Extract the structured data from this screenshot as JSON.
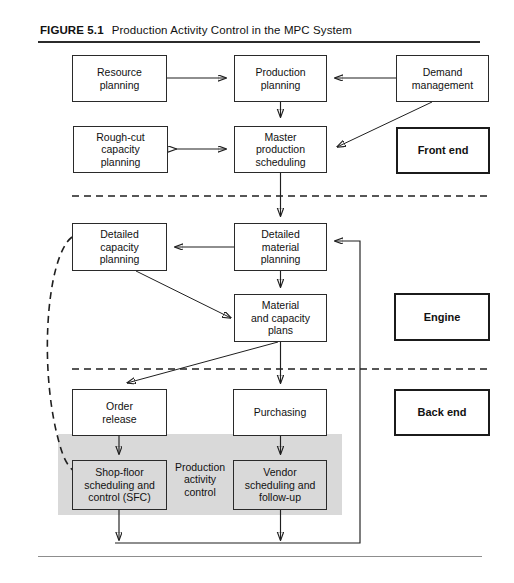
{
  "figure": {
    "label": "FIGURE 5.1",
    "title": "Production Activity Control in the MPC System"
  },
  "colors": {
    "shade_band": "#d9d9d9",
    "line": "#1f1f1f",
    "box_border": "#2a2a2a",
    "heavy_border": "#1b1b1b",
    "rule": "#2b2b2b"
  },
  "sections": [
    {
      "id": "front-end",
      "label": "Front end"
    },
    {
      "id": "engine",
      "label": "Engine"
    },
    {
      "id": "back-end",
      "label": "Back end"
    }
  ],
  "nodes": {
    "resource_planning": "Resource\nplanning",
    "production_planning": "Production\nplanning",
    "demand_management": "Demand\nmanagement",
    "rough_cut": "Rough-cut\ncapacity\nplanning",
    "master_production_scheduling": "Master\nproduction\nscheduling",
    "detailed_capacity_planning": "Detailed\ncapacity\nplanning",
    "detailed_material_planning": "Detailed\nmaterial\nplanning",
    "material_and_capacity_plans": "Material\nand capacity\nplans",
    "order_release": "Order\nrelease",
    "purchasing": "Purchasing",
    "shop_floor": "Shop-floor\nscheduling and\ncontrol (SFC)",
    "vendor_scheduling": "Vendor\nscheduling and\nfollow-up"
  },
  "annotations": {
    "production_activity_control": "Production\nactivity\ncontrol"
  }
}
